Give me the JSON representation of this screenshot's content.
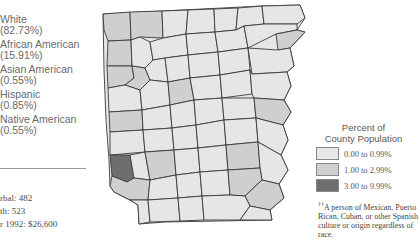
{
  "race_breakdown": [
    {
      "label": "White",
      "pct": "(82.73%)"
    },
    {
      "label": "African American",
      "pct": "(15.91%)"
    },
    {
      "label": "Asian American",
      "pct": "(0.55%)"
    },
    {
      "label": "Hispanic",
      "pct": "(0.85%)"
    },
    {
      "label": "Native American",
      "pct": "(0.55%)"
    }
  ],
  "stats": [
    "rbal:  482",
    "th:  523",
    "r 1992: $26,600"
  ],
  "legend": {
    "title_line1": "Percent of",
    "title_line2": "County Population",
    "items": [
      {
        "label": "0.00 to 0.99%",
        "color": "#e8e8e8"
      },
      {
        "label": "1.00 to 2.99%",
        "color": "#cfcfcf"
      },
      {
        "label": "3.00 to 9.99%",
        "color": "#6e6e6e"
      }
    ]
  },
  "footnote": {
    "marker": "††",
    "text": "A person of Mexican, Puerto Rican, Cuban, or other Spanish culture or origin regardless of race."
  },
  "map": {
    "subject": "Hispanic population by county (Arkansas)",
    "colors": {
      "low": "#e8e8e8",
      "mid": "#cfcfcf",
      "high": "#6e6e6e",
      "border": "#3a3a3a"
    }
  }
}
